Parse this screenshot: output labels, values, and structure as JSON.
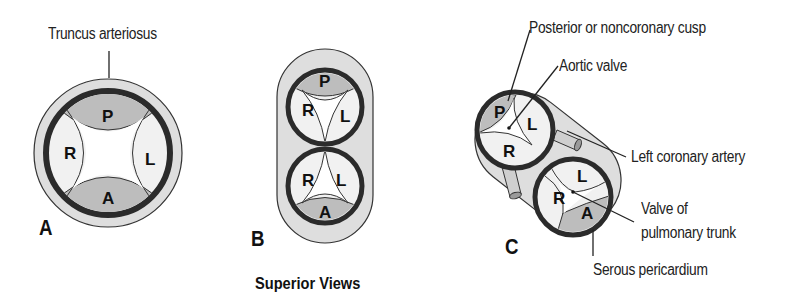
{
  "figure": {
    "caption": "Superior Views",
    "colors": {
      "outer_wall": "#dedede",
      "dark_ring": "#2b2b2b",
      "cusp_shaded": "#bdbdbd",
      "cusp_light": "#f1f1f1",
      "lumen": "#ffffff",
      "outline": "#333333"
    },
    "panels": [
      {
        "letter": "A",
        "title": "Truncus arteriosus",
        "cusps": [
          "P",
          "R",
          "L",
          "A"
        ]
      },
      {
        "letter": "B",
        "upper_vessel_cusps": [
          "P",
          "R",
          "L"
        ],
        "lower_vessel_cusps": [
          "R",
          "L",
          "A"
        ]
      },
      {
        "letter": "C",
        "upper_vessel_cusps": [
          "P",
          "L",
          "R"
        ],
        "lower_vessel_cusps": [
          "L",
          "R",
          "A"
        ],
        "labels": {
          "posterior_cusp": "Posterior or noncoronary cusp",
          "aortic_valve": "Aortic valve",
          "left_coronary": "Left coronary artery",
          "pulmonary_valve_line1": "Valve of",
          "pulmonary_valve_line2": "pulmonary trunk",
          "serous_pericardium": "Serous pericardium"
        }
      }
    ]
  }
}
